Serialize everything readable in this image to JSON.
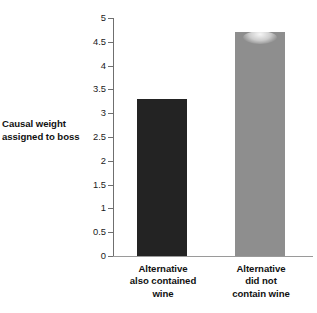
{
  "chart_data": {
    "type": "bar",
    "title": "",
    "xlabel": "",
    "ylabel": "Causal weight assigned to boss",
    "ylabel_lines": [
      "Causal weight",
      "assigned to boss"
    ],
    "categories": [
      "Alternative also contained wine",
      "Alternative did not contain wine"
    ],
    "category_lines": [
      [
        "Alternative",
        "also contained",
        "wine"
      ],
      [
        "Alternative",
        "did not",
        "contain wine"
      ]
    ],
    "values": [
      3.3,
      4.7
    ],
    "ylim": [
      0,
      5
    ],
    "ytick_step": 0.5,
    "yticks": [
      "0",
      "0.5",
      "1",
      "1.5",
      "2",
      "2.5",
      "3",
      "3.5",
      "4",
      "4.5",
      "5"
    ],
    "ytick_values": [
      0,
      0.5,
      1,
      1.5,
      2,
      2.5,
      3,
      3.5,
      4,
      4.5,
      5
    ],
    "grid": false,
    "legend": false,
    "legend_position": "none",
    "bar_colors": [
      "#232323",
      "#8e8e8e"
    ],
    "axis_color": "#6f6f6f",
    "background": "#ffffff"
  }
}
